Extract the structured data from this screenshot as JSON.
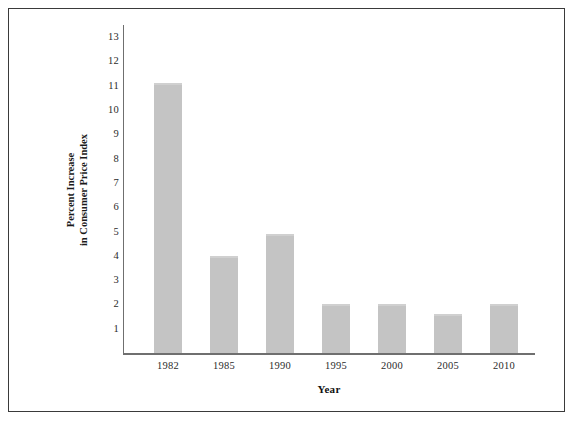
{
  "chart_data": {
    "type": "bar",
    "title": "",
    "subtitle": "",
    "xlabel": "Year",
    "ylabel": "Percent Increase in Consumer Price Index",
    "ylabel_line1": "Percent Increase",
    "ylabel_line2": "in Consumer Price Index",
    "categories": [
      "1982",
      "1985",
      "1990",
      "1995",
      "2000",
      "2005",
      "2010"
    ],
    "values": [
      11.1,
      4.0,
      4.9,
      2.0,
      2.0,
      1.6,
      2.0
    ],
    "ylim": [
      0,
      13.5
    ],
    "yticks": [
      "13",
      "12",
      "11",
      "10",
      "9",
      "8",
      "7",
      "6",
      "5",
      "4",
      "3",
      "2",
      "1"
    ],
    "ytick_values": [
      13,
      12,
      11,
      10,
      9,
      8,
      7,
      6,
      5,
      4,
      3,
      2,
      1
    ],
    "grid": false,
    "legend": false,
    "legend_position": "none",
    "bar_color": "#c4c4c4",
    "axis_color": "#6f6f6f",
    "text_color": "#2b2b2b",
    "frame_color": "#3a3a3a",
    "background_color": "#ffffff"
  }
}
